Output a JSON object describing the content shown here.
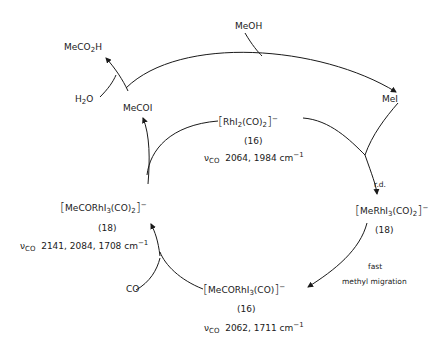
{
  "species": {
    "meoh": "MeOH",
    "mei": "MeI",
    "meco2h": {
      "pre": "MeCO",
      "sub": "2",
      "post": "H"
    },
    "h2o": {
      "pre": "H",
      "sub": "2",
      "post": "O"
    },
    "mecoi": "MeCOI",
    "co": "CO"
  },
  "complexes": {
    "top": {
      "formula_pre": "RhI",
      "formula_sub1": "2",
      "formula_mid": "(CO)",
      "formula_sub2": "2",
      "charge": "−",
      "electron_count": "(16)",
      "nu_label": "ν",
      "nu_sub": "CO",
      "ir": "2064, 1984 cm",
      "ir_exp": "−1"
    },
    "right": {
      "formula_pre": "MeRhI",
      "formula_sub1": "3",
      "formula_mid": "(CO)",
      "formula_sub2": "2",
      "charge": "−",
      "electron_count": "(18)"
    },
    "bottom": {
      "formula_pre": "MeCORhI",
      "formula_sub1": "3",
      "formula_mid": "(CO)",
      "charge": "−",
      "electron_count": "(16)",
      "nu_label": "ν",
      "nu_sub": "CO",
      "ir": "2062, 1711 cm",
      "ir_exp": "−1"
    },
    "left": {
      "formula_pre": "MeCORhI",
      "formula_sub1": "3",
      "formula_mid": "(CO)",
      "formula_sub2": "2",
      "charge": "−",
      "electron_count": "(18)",
      "nu_label": "ν",
      "nu_sub": "CO",
      "ir": "2141, 2084, 1708 cm",
      "ir_exp": "−1"
    }
  },
  "step_labels": {
    "rate_determining": "r.d.",
    "fast": "fast",
    "migration": "methyl migration"
  },
  "colors": {
    "ink": "#1a1a1a",
    "background": "#ffffff"
  }
}
